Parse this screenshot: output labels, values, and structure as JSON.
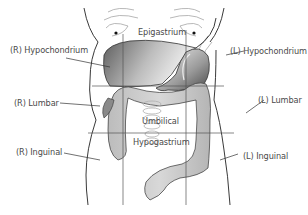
{
  "regions": {
    "r_hypochondrium": "(R) Hypochondrium",
    "epigastrium": "Epigastrium",
    "l_hypochondrium": "(L) Hypochondrium",
    "r_lumbar": "(R) Lumbar",
    "umbilical": "Umbilical",
    "l_lumbar": "(L) Lumbar",
    "r_inguinal": "(R) Inguinal",
    "hypogastrium": "Hypogastrium",
    "l_inguinal": "(L) Inguinal"
  },
  "organs": [
    "liver",
    "stomach",
    "large-intestine",
    "small-intestine"
  ],
  "colors": {
    "outline": "#222222",
    "grid_line": "#555555",
    "liver_dark": "#6e6e6e",
    "liver_light": "#f2f2f2",
    "intestine_fill": "#c9c9c9",
    "label_text": "#4a4a4a"
  }
}
